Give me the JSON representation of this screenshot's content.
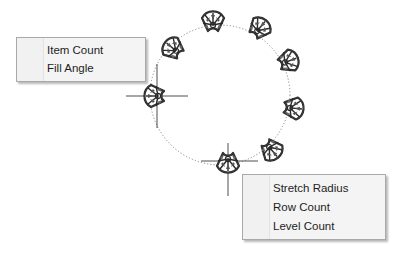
{
  "canvas": {
    "path_circle": {
      "cx": 220,
      "cy": 95,
      "r": 70,
      "style": "dotted"
    },
    "items": [
      {
        "name": "pattern-item-1",
        "x": 175,
        "y": 50,
        "angle": 130
      },
      {
        "name": "pattern-item-2",
        "x": 213,
        "y": 24,
        "angle": 180
      },
      {
        "name": "pattern-item-3",
        "x": 258,
        "y": 30,
        "angle": 225
      },
      {
        "name": "pattern-item-4",
        "x": 286,
        "y": 62,
        "angle": 260
      },
      {
        "name": "pattern-item-5",
        "x": 291,
        "y": 108,
        "angle": 275
      },
      {
        "name": "pattern-item-6",
        "x": 270,
        "y": 148,
        "angle": 320
      },
      {
        "name": "pattern-item-7",
        "x": 228,
        "y": 160,
        "angle": 0
      },
      {
        "name": "pattern-item-8",
        "x": 157,
        "y": 96,
        "angle": 90
      }
    ],
    "crosshairs": [
      {
        "name": "crosshair-left",
        "x": 157,
        "y": 96,
        "size": 30
      },
      {
        "name": "crosshair-bottom",
        "x": 228,
        "y": 160,
        "size": 30
      }
    ]
  },
  "menu_left": {
    "items": [
      {
        "label": "Item Count"
      },
      {
        "label": "Fill Angle"
      }
    ]
  },
  "menu_right": {
    "items": [
      {
        "label": "Stretch Radius"
      },
      {
        "label": "Row Count"
      },
      {
        "label": "Level Count"
      }
    ]
  }
}
